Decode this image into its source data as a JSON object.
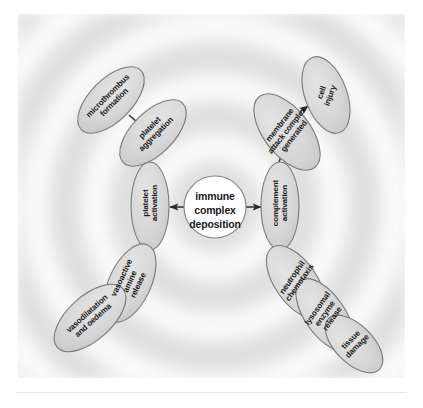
{
  "figure": {
    "type": "radial-flow-diagram",
    "title_visible": false,
    "background": {
      "panel_color": "#f7f7f7",
      "ring_pattern": "concentric-rings",
      "ring_light": "#ffffff",
      "ring_dark": "#d9d9d9",
      "ring_count": 5
    },
    "palette": {
      "node_fill": "#d6d6d6",
      "node_stroke": "#7a7a7a",
      "center_fill": "#ffffff",
      "center_stroke": "#8a8a8a",
      "arrow_color": "#2b2b2b",
      "text_color": "#1a1a1a"
    }
  },
  "center": {
    "id": "immune-complex-deposition",
    "label": "immune\ncomplex\ndeposition",
    "shape": "circle"
  },
  "nodes": [
    {
      "id": "platelet-activation",
      "label": "platelet\nactivation",
      "branch": "left",
      "rotation": -90
    },
    {
      "id": "complement-activation",
      "label": "complement\nactivation",
      "branch": "right",
      "rotation": -90
    },
    {
      "id": "platelet-aggregation",
      "label": "platelet\naggregation",
      "branch": "upper-left",
      "rotation": -45
    },
    {
      "id": "microthrombus-formation",
      "label": "microthrombus\nformation",
      "branch": "upper-left",
      "rotation": -45
    },
    {
      "id": "vasoactive-amine-release",
      "label": "vasoactive\namine\nrelease",
      "branch": "lower-left",
      "rotation": -65
    },
    {
      "id": "vasodilatation-and-oedema",
      "label": "vasodilatation\nand oedema",
      "branch": "lower-left",
      "rotation": -42
    },
    {
      "id": "membrane-attack-complex",
      "label": "membrane\nattack complex\ngenerated",
      "branch": "upper-right",
      "rotation": -52
    },
    {
      "id": "cell-injury",
      "label": "cell\ninjury",
      "branch": "upper-right",
      "rotation": -70
    },
    {
      "id": "neutrophil-chemotaxis",
      "label": "neutrophil\nchemotaxis",
      "branch": "lower-right",
      "rotation": -55
    },
    {
      "id": "lysosomal-enzyme-release",
      "label": "lysosomal\nenzyme\nrelease",
      "branch": "lower-right",
      "rotation": -55
    },
    {
      "id": "tissue-damage",
      "label": "tissue\ndamage",
      "branch": "lower-right",
      "rotation": -45
    }
  ],
  "edges": [
    {
      "from": "immune-complex-deposition",
      "to": "platelet-activation",
      "kind": "arrow"
    },
    {
      "from": "immune-complex-deposition",
      "to": "complement-activation",
      "kind": "arrow"
    },
    {
      "from": "platelet-activation",
      "to": "platelet-aggregation",
      "kind": "arrow"
    },
    {
      "from": "platelet-aggregation",
      "to": "microthrombus-formation",
      "kind": "line"
    },
    {
      "from": "platelet-activation",
      "to": "vasoactive-amine-release",
      "kind": "arrow"
    },
    {
      "from": "vasoactive-amine-release",
      "to": "vasodilatation-and-oedema",
      "kind": "line"
    },
    {
      "from": "complement-activation",
      "to": "membrane-attack-complex",
      "kind": "arrow"
    },
    {
      "from": "membrane-attack-complex",
      "to": "cell-injury",
      "kind": "arrow"
    },
    {
      "from": "complement-activation",
      "to": "neutrophil-chemotaxis",
      "kind": "arrow"
    },
    {
      "from": "neutrophil-chemotaxis",
      "to": "lysosomal-enzyme-release",
      "kind": "arrow"
    },
    {
      "from": "lysosomal-enzyme-release",
      "to": "tissue-damage",
      "kind": "arrow"
    }
  ]
}
